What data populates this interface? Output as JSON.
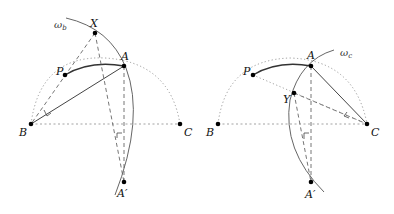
{
  "figures": [
    {
      "id": "left",
      "circle_label": "ω",
      "circle_sub": "b",
      "points": {
        "X": {
          "label": "X",
          "x": 95,
          "y": 33
        },
        "A": {
          "label": "A",
          "x": 124,
          "y": 66
        },
        "P": {
          "label": "P",
          "x": 65,
          "y": 75
        },
        "B": {
          "label": "B",
          "x": 31,
          "y": 124
        },
        "C": {
          "label": "C",
          "x": 180,
          "y": 124
        },
        "A_prime": {
          "label": "A′",
          "x": 124,
          "y": 182
        }
      }
    },
    {
      "id": "right",
      "circle_label": "ω",
      "circle_sub": "c",
      "points": {
        "A": {
          "label": "A",
          "x": 311,
          "y": 66
        },
        "P": {
          "label": "P",
          "x": 253,
          "y": 75
        },
        "Y": {
          "label": "Y",
          "x": 294,
          "y": 93
        },
        "B": {
          "label": "B",
          "x": 218,
          "y": 124
        },
        "C": {
          "label": "C",
          "x": 367,
          "y": 124
        },
        "A_prime": {
          "label": "A′",
          "x": 311,
          "y": 182
        }
      }
    }
  ],
  "colors": {
    "stroke": "#444444",
    "thin": "#777777",
    "dotted": "#999999",
    "point": "#000000"
  }
}
